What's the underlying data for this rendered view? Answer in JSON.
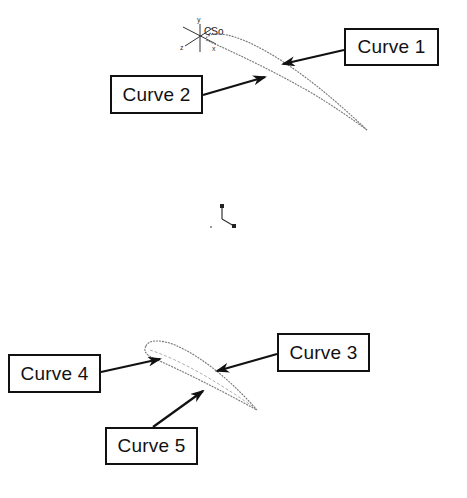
{
  "diagram": {
    "top_airfoil": {
      "coordinate_system": {
        "label": "CSo",
        "axes": {
          "x": "x",
          "y": "y",
          "z": "z"
        }
      }
    },
    "labels": [
      {
        "id": "curve1",
        "text": "Curve 1"
      },
      {
        "id": "curve2",
        "text": "Curve 2"
      },
      {
        "id": "curve3",
        "text": "Curve 3"
      },
      {
        "id": "curve4",
        "text": "Curve 4"
      },
      {
        "id": "curve5",
        "text": "Curve 5"
      }
    ],
    "colors": {
      "outline": "#111111",
      "curve_stroke": "#777777",
      "background": "#ffffff"
    }
  }
}
